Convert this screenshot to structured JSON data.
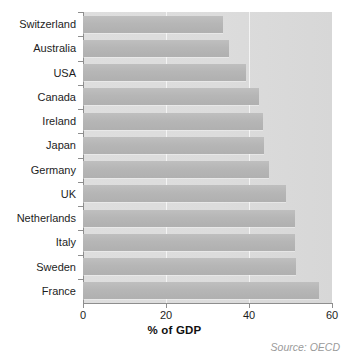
{
  "chart_data": {
    "type": "bar",
    "orientation": "horizontal",
    "title": "",
    "subtitle": "",
    "xlabel": "% of GDP",
    "ylabel": "",
    "xlim": [
      0,
      60
    ],
    "xticks": [
      "0",
      "20",
      "40",
      "60"
    ],
    "xtick_values": [
      0,
      20,
      40,
      60
    ],
    "grid": "vertical gridlines at 20 and 40",
    "legend": "none",
    "categories": [
      "Switzerland",
      "Australia",
      "USA",
      "Canada",
      "Ireland",
      "Japan",
      "Germany",
      "UK",
      "Netherlands",
      "Italy",
      "Sweden",
      "France"
    ],
    "values": [
      33.8,
      35.2,
      39.3,
      42.5,
      43.4,
      43.6,
      44.8,
      48.8,
      51.0,
      51.0,
      51.3,
      56.8
    ],
    "annotations": [
      "Source: OECD"
    ],
    "colors": {
      "bar": "#b6b6b6",
      "plot_background": "#dcdcdc",
      "gridline": "#f4f4f4",
      "axis": "#8e8e8e",
      "text": "#1d1d1d",
      "source_text": "#9a9a9a"
    }
  },
  "source_note": "Source: OECD"
}
